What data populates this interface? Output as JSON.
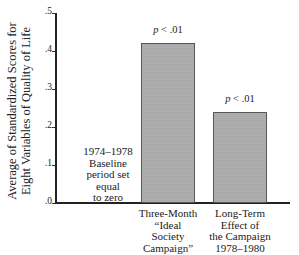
{
  "chart_data": {
    "type": "bar",
    "title": "",
    "xlabel": "",
    "ylabel": "Average of Standardized Scores for Eight Variables of Quality of Life",
    "ylabel_lines": [
      "Average of Standardized Scores for",
      "Eight Variables of Quality of Life"
    ],
    "categories": [
      "Three-Month “Ideal Society Campaign”",
      "Long-Term Effect of the Campaign 1978–1980"
    ],
    "category_lines": [
      [
        "Three-Month",
        "“Ideal",
        "Society",
        "Campaign”"
      ],
      [
        "Long-Term",
        "Effect of",
        "the Campaign",
        "1978–1980"
      ]
    ],
    "values": [
      0.42,
      0.24
    ],
    "bar_annotations": [
      "p < .01",
      "p < .01"
    ],
    "ylim": [
      0,
      0.5
    ],
    "yticks": [
      ".0",
      ".1",
      ".2",
      ".3",
      ".4",
      ".5"
    ],
    "ytick_values": [
      0,
      0.1,
      0.2,
      0.3,
      0.4,
      0.5
    ],
    "grid": false,
    "legend": null,
    "annotations": [
      {
        "text_lines": [
          "1974–1978",
          "Baseline",
          "period set",
          "equal",
          "to zero"
        ],
        "position": "left of bars, inside plot"
      }
    ],
    "bar_color": "#a8a8a8"
  },
  "ui": {
    "p_prefix": "p",
    "p_suffix": " < .01"
  }
}
